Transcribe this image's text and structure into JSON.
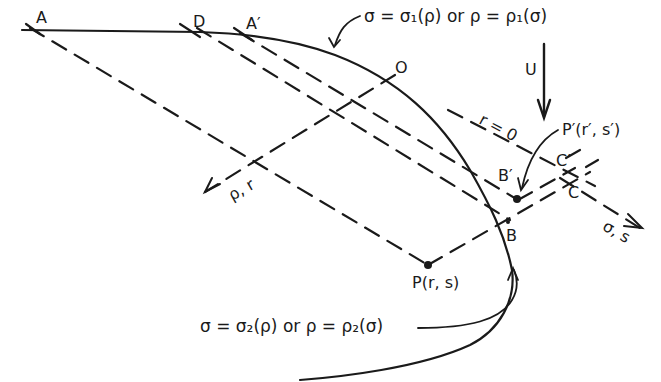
{
  "diagram": {
    "type": "characteristic-curves",
    "points": {
      "A": "A",
      "D": "D",
      "A_prime": "A′",
      "O": "O",
      "B": "B",
      "B_prime": "B′",
      "C": "C",
      "C_prime": "C′",
      "P": "P(r, s)",
      "P_prime": "P′(r′, s′)"
    },
    "curves": {
      "upper": "σ = σ₁(ρ) or ρ = ρ₁(σ)",
      "lower": "σ = σ₂(ρ) or ρ = ρ₂(σ)"
    },
    "axes": {
      "rho_r": "ρ, r",
      "sigma_s": "σ, s"
    },
    "arrow_U": "U",
    "line_r0": "r = 0",
    "colors": {
      "ink": "#1a1a1a",
      "background": "#ffffff"
    }
  }
}
